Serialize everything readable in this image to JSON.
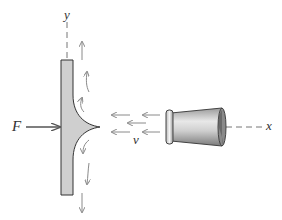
{
  "labels": {
    "y_axis": "y",
    "x_axis": "x",
    "force": "F",
    "velocity": "v"
  },
  "colors": {
    "plate_fill": "#cfcfcf",
    "outline": "#333333",
    "flow_arrow": "#8a8a8a",
    "force_arrow": "#555555",
    "axis_dash": "#777777"
  },
  "elements": [
    "vertical plate",
    "fluid jet fillet",
    "nozzle",
    "jet velocity arrows",
    "deflected flow arrows",
    "applied force arrow",
    "x axis",
    "y axis"
  ]
}
